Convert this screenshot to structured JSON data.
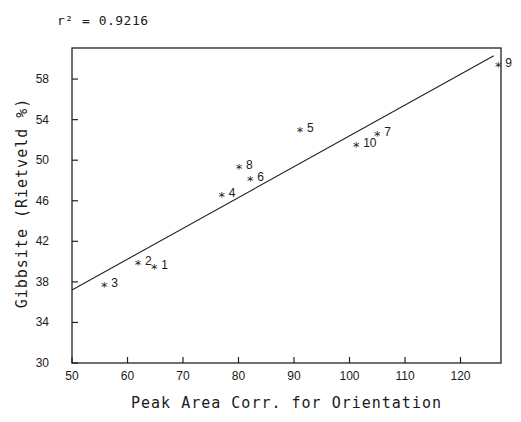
{
  "annotation": "r² = 0.9216",
  "chart_data": {
    "type": "scatter",
    "title": "",
    "annotation": "r² = 0.9216",
    "xlabel": "Peak Area Corr. for Orientation",
    "ylabel": "Gibbsite (Rietveld %)",
    "xlim": [
      50,
      128
    ],
    "ylim": [
      30,
      61
    ],
    "xticks": [
      50,
      60,
      70,
      80,
      90,
      100,
      110,
      120
    ],
    "yticks": [
      30,
      34,
      38,
      42,
      46,
      50,
      54,
      58
    ],
    "grid": false,
    "legend": null,
    "marker": "asterisk",
    "points": [
      {
        "label": "1",
        "x": 64.8,
        "y": 39.4
      },
      {
        "label": "2",
        "x": 61.9,
        "y": 39.8
      },
      {
        "label": "3",
        "x": 55.8,
        "y": 37.6
      },
      {
        "label": "4",
        "x": 77.0,
        "y": 46.5
      },
      {
        "label": "5",
        "x": 91.1,
        "y": 52.9
      },
      {
        "label": "6",
        "x": 82.1,
        "y": 48.0
      },
      {
        "label": "7",
        "x": 105.0,
        "y": 52.5
      },
      {
        "label": "8",
        "x": 80.1,
        "y": 49.2
      },
      {
        "label": "9",
        "x": 126.8,
        "y": 59.3
      },
      {
        "label": "10",
        "x": 101.2,
        "y": 51.4
      }
    ],
    "fit_line": {
      "x": [
        50,
        126
      ],
      "y": [
        37.2,
        60.3
      ],
      "r_squared": 0.9216
    }
  }
}
